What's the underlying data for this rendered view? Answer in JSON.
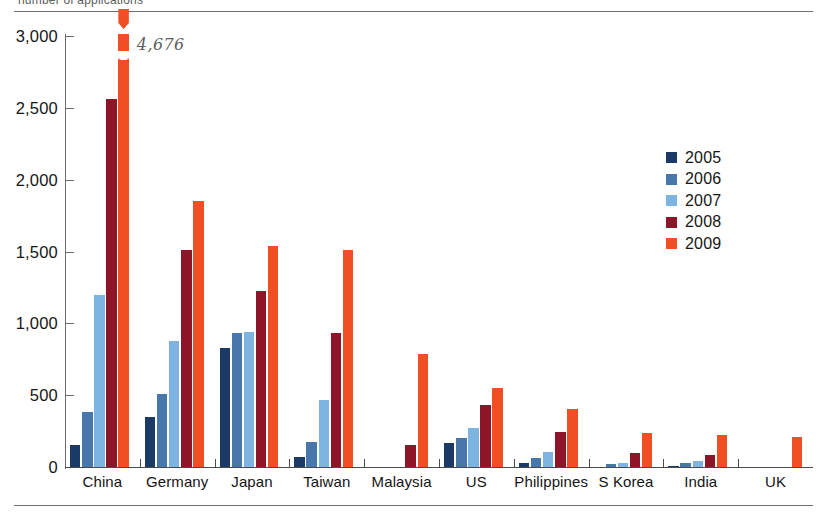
{
  "caption": {
    "text": "number of applications"
  },
  "chart_data": {
    "type": "bar",
    "title": "",
    "subtitle": "",
    "xlabel": "",
    "ylabel": "",
    "ylim": [
      0,
      3000
    ],
    "yticks": [
      0,
      500,
      1000,
      1500,
      2000,
      2500,
      3000
    ],
    "ytick_labels": [
      "0",
      "500",
      "1,000",
      "1,500",
      "2,000",
      "2,500",
      "3,000"
    ],
    "grid": false,
    "legend_position": "upper right",
    "categories": [
      "China",
      "Germany",
      "Japan",
      "Taiwan",
      "Malaysia",
      "US",
      "Philippines",
      "S Korea",
      "India",
      "UK"
    ],
    "series": [
      {
        "name": "2005",
        "color": "#1b3a66",
        "values": [
          150,
          350,
          825,
          70,
          0,
          165,
          25,
          0,
          10,
          0
        ]
      },
      {
        "name": "2006",
        "color": "#4877ab",
        "values": [
          385,
          510,
          930,
          175,
          0,
          205,
          60,
          20,
          30,
          0
        ]
      },
      {
        "name": "2007",
        "color": "#7eb4e2",
        "values": [
          1200,
          880,
          940,
          465,
          0,
          275,
          105,
          30,
          45,
          0
        ]
      },
      {
        "name": "2008",
        "color": "#8e1528",
        "values": [
          2560,
          1510,
          1225,
          930,
          155,
          430,
          245,
          100,
          85,
          0
        ]
      },
      {
        "name": "2009",
        "color": "#f04e23",
        "values": [
          4676,
          1850,
          1540,
          1510,
          790,
          550,
          405,
          235,
          225,
          210
        ]
      }
    ],
    "annotations": [
      {
        "text": "4,676",
        "category": "China",
        "series": "2009",
        "note": "bar is truncated with an axis break; true value printed beside the bar"
      }
    ]
  },
  "legend": {
    "items": [
      {
        "label": "2005",
        "color": "#1b3a66"
      },
      {
        "label": "2006",
        "color": "#4877ab"
      },
      {
        "label": "2007",
        "color": "#7eb4e2"
      },
      {
        "label": "2008",
        "color": "#8e1528"
      },
      {
        "label": "2009",
        "color": "#f04e23"
      }
    ]
  }
}
